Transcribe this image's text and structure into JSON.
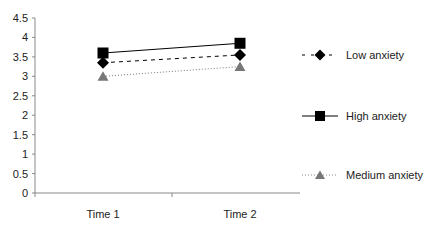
{
  "chart_data": {
    "type": "line",
    "title": "",
    "xlabel": "",
    "ylabel": "",
    "categories": [
      "Time 1",
      "Time 2"
    ],
    "ylim": [
      0,
      4.5
    ],
    "yticks": [
      0,
      0.5,
      1,
      1.5,
      2,
      2.5,
      3,
      3.5,
      4,
      4.5
    ],
    "ytick_labels": [
      "0",
      "0.5",
      "1",
      "1.5",
      "2",
      "2.5",
      "3",
      "3.5",
      "4",
      "4.5"
    ],
    "grid": false,
    "legend_position": "right",
    "series": [
      {
        "name": "Low anxiety",
        "values": [
          3.35,
          3.55
        ],
        "marker": "diamond",
        "line": "dashed",
        "color": "#000000"
      },
      {
        "name": "High anxiety",
        "values": [
          3.6,
          3.85
        ],
        "marker": "square",
        "line": "solid",
        "color": "#000000"
      },
      {
        "name": "Medium anxiety",
        "values": [
          3.0,
          3.25
        ],
        "marker": "triangle",
        "line": "dotted",
        "color": "#777777"
      }
    ]
  },
  "legend": {
    "items": [
      {
        "label": "Low anxiety"
      },
      {
        "label": "High anxiety"
      },
      {
        "label": "Medium anxiety"
      }
    ]
  },
  "axis": {
    "x_labels": [
      "Time 1",
      "Time 2"
    ],
    "y_labels": [
      "0",
      "0.5",
      "1",
      "1.5",
      "2",
      "2.5",
      "3",
      "3.5",
      "4",
      "4.5"
    ]
  }
}
